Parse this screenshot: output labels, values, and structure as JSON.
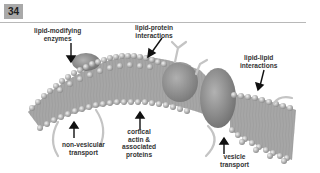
{
  "figure": {
    "number": "34",
    "colors": {
      "badge_bg": "#a9a9a9",
      "rule": "#b8b8b8",
      "lipid_head": "#bdbdbd",
      "protein": "#8a8a8a",
      "arrow": "#111111"
    },
    "labels": {
      "lipid_modifying": "lipid-modifying\nenzymes",
      "lipid_protein": "lipid-protein\ninteractions",
      "lipid_lipid": "lipid-lipid\ninteractions",
      "non_vesicular": "non-vesicular\ntransport",
      "cortical_actin": "cortical\nactin &\nassociated\nproteins",
      "vesicle": "vesicle\ntransport"
    }
  }
}
